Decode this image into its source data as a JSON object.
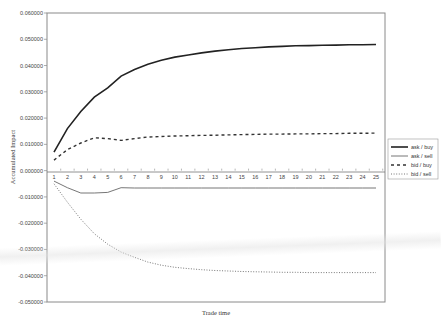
{
  "chart_data": {
    "type": "line",
    "title": "",
    "xlabel": "Trade time",
    "ylabel": "Accumulated Impact",
    "ylim": [
      -0.05,
      0.06
    ],
    "yticks": [
      "0.060000",
      "0.050000",
      "0.040000",
      "0.030000",
      "0.020000",
      "0.010000",
      "0.000000",
      "-0.010000",
      "-0.020000",
      "-0.030000",
      "-0.040000",
      "-0.050000"
    ],
    "categories": [
      1,
      2,
      3,
      4,
      5,
      6,
      7,
      8,
      9,
      10,
      11,
      12,
      13,
      14,
      15,
      16,
      17,
      18,
      19,
      20,
      21,
      22,
      23,
      24,
      25
    ],
    "grid": false,
    "legend_position": "right",
    "series": [
      {
        "name": "ask / buy",
        "style": "solid-thick",
        "values": [
          0.007,
          0.016,
          0.0225,
          0.028,
          0.0315,
          0.036,
          0.0385,
          0.0405,
          0.042,
          0.0432,
          0.044,
          0.0448,
          0.0455,
          0.046,
          0.0465,
          0.0468,
          0.0471,
          0.0473,
          0.0475,
          0.0476,
          0.0477,
          0.0478,
          0.0479,
          0.0479,
          0.048
        ]
      },
      {
        "name": "ask / sell",
        "style": "solid-thin",
        "values": [
          -0.004,
          -0.0065,
          -0.0085,
          -0.0085,
          -0.0083,
          -0.0065,
          -0.0066,
          -0.0066,
          -0.0066,
          -0.0066,
          -0.0066,
          -0.0066,
          -0.0066,
          -0.0066,
          -0.0066,
          -0.0066,
          -0.0066,
          -0.0066,
          -0.0066,
          -0.0066,
          -0.0066,
          -0.0066,
          -0.0066,
          -0.0066,
          -0.0066
        ]
      },
      {
        "name": "bid / buy",
        "style": "dashed",
        "values": [
          0.004,
          0.008,
          0.0105,
          0.0125,
          0.0122,
          0.0115,
          0.0122,
          0.0128,
          0.013,
          0.0132,
          0.0133,
          0.0134,
          0.0135,
          0.0136,
          0.0137,
          0.0138,
          0.0139,
          0.0139,
          0.014,
          0.014,
          0.0141,
          0.0141,
          0.0142,
          0.0142,
          0.0143
        ]
      },
      {
        "name": "bid / sell",
        "style": "dotted",
        "values": [
          -0.005,
          -0.012,
          -0.0185,
          -0.024,
          -0.028,
          -0.031,
          -0.033,
          -0.0348,
          -0.036,
          -0.0368,
          -0.0373,
          -0.0377,
          -0.038,
          -0.0382,
          -0.0384,
          -0.0385,
          -0.0386,
          -0.0387,
          -0.0387,
          -0.0388,
          -0.0388,
          -0.0388,
          -0.0388,
          -0.0388,
          -0.0388
        ]
      }
    ]
  },
  "colors": {
    "axis": "#888888",
    "line": "#333333",
    "background": "#ffffff"
  }
}
